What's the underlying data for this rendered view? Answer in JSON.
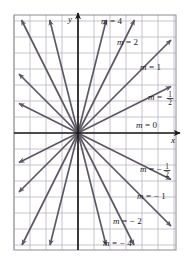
{
  "figure": {
    "axis_labels": {
      "x": "x",
      "y": "y"
    },
    "colors": {
      "ray": "#5d5765",
      "axis": "#1a1a1a",
      "grid": "#b9b4c2",
      "frame": "#8f8a98",
      "label_text": "#1a1a1a",
      "background": "#ffffff"
    },
    "grid": {
      "spacing_px": 16,
      "columns": 10,
      "rows": 15,
      "visible": true
    },
    "origin": {
      "x": 78,
      "y": 133
    }
  },
  "chart_data": {
    "type": "line",
    "xlabel": "x",
    "ylabel": "y",
    "grid": true,
    "legend": "inline-labels",
    "xlim": [
      -4,
      6.2
    ],
    "ylim": [
      -7.3,
      7.4
    ],
    "series": [
      {
        "name": "m = 4",
        "slope": 4,
        "label": "m = 4",
        "label_m": "m",
        "label_eq": "=",
        "label_value": "4",
        "label_num": "",
        "label_den": "",
        "label_neg": false,
        "label_x": 101,
        "label_y": 24
      },
      {
        "name": "m = 2",
        "slope": 2,
        "label": "m = 2",
        "label_m": "m",
        "label_eq": "=",
        "label_value": "2",
        "label_num": "",
        "label_den": "",
        "label_neg": false,
        "label_x": 117,
        "label_y": 45
      },
      {
        "name": "m = 1",
        "slope": 1,
        "label": "m = 1",
        "label_m": "m",
        "label_eq": "=",
        "label_value": "1",
        "label_num": "",
        "label_den": "",
        "label_neg": false,
        "label_x": 140,
        "label_y": 70
      },
      {
        "name": "m = 1/2",
        "slope": 0.5,
        "label": "m = 1/2",
        "label_m": "m",
        "label_eq": "=",
        "label_value": "",
        "label_num": "1",
        "label_den": "2",
        "label_neg": false,
        "label_x": 148,
        "label_y": 100
      },
      {
        "name": "m = 0",
        "slope": 0,
        "label": "m = 0",
        "label_m": "m",
        "label_eq": "=",
        "label_value": "0",
        "label_num": "",
        "label_den": "",
        "label_neg": false,
        "label_x": 136,
        "label_y": 128
      },
      {
        "name": "m = -1/2",
        "slope": -0.5,
        "label": "m = -1/2",
        "label_m": "m",
        "label_eq": "=",
        "label_value": "",
        "label_num": "1",
        "label_den": "2",
        "label_neg": true,
        "label_x": 140,
        "label_y": 172
      },
      {
        "name": "m = -1",
        "slope": -1,
        "label": "m = -1",
        "label_m": "m",
        "label_eq": "=",
        "label_value": "1",
        "label_num": "",
        "label_den": "",
        "label_neg": true,
        "label_x": 137,
        "label_y": 199
      },
      {
        "name": "m = -2",
        "slope": -2,
        "label": "m = -2",
        "label_m": "m",
        "label_eq": "=",
        "label_value": "2",
        "label_num": "",
        "label_den": "",
        "label_neg": true,
        "label_x": 113,
        "label_y": 224
      },
      {
        "name": "m = -4",
        "slope": -4,
        "label": "m = -4",
        "label_m": "m",
        "label_eq": "=",
        "label_value": "4",
        "label_num": "",
        "label_den": "",
        "label_neg": true,
        "label_x": 103,
        "label_y": 246
      }
    ]
  }
}
